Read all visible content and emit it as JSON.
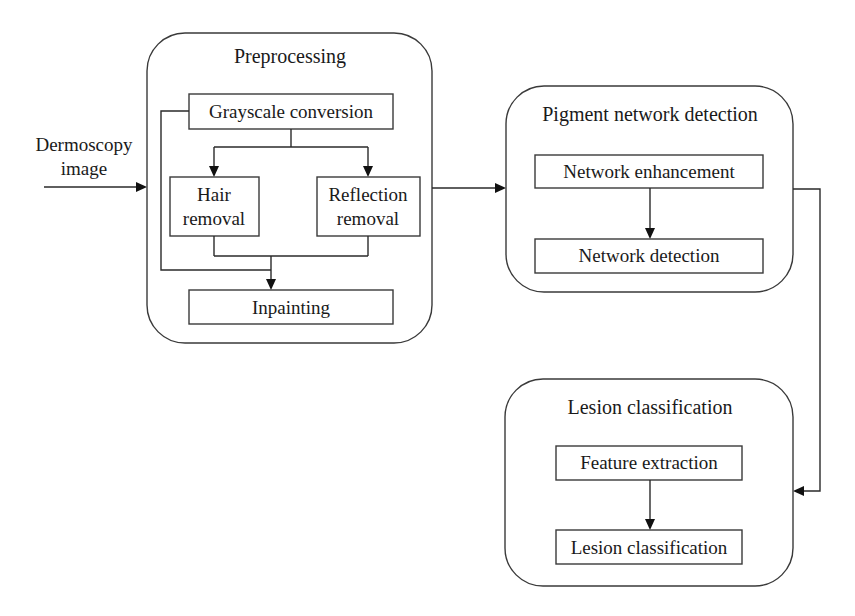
{
  "diagram": {
    "input_label": [
      "Dermoscopy",
      "image"
    ],
    "groups": {
      "preprocessing": {
        "title": "Preprocessing",
        "nodes": {
          "grayscale": "Grayscale conversion",
          "hair": [
            "Hair",
            "removal"
          ],
          "reflection": [
            "Reflection",
            "removal"
          ],
          "inpainting": "Inpainting"
        }
      },
      "pigment": {
        "title": "Pigment network detection",
        "nodes": {
          "enhancement": "Network enhancement",
          "detection": "Network detection"
        }
      },
      "lesion": {
        "title": "Lesion classification",
        "nodes": {
          "feature": "Feature extraction",
          "classification": "Lesion classification"
        }
      }
    },
    "edges": [
      {
        "from": "Dermoscopy image",
        "to": "Preprocessing"
      },
      {
        "from": "Grayscale conversion",
        "to": "Hair removal"
      },
      {
        "from": "Grayscale conversion",
        "to": "Reflection removal"
      },
      {
        "from": "Hair removal",
        "to": "Inpainting"
      },
      {
        "from": "Reflection removal",
        "to": "Inpainting"
      },
      {
        "from": "Grayscale conversion",
        "to": "Inpainting"
      },
      {
        "from": "Preprocessing",
        "to": "Pigment network detection"
      },
      {
        "from": "Network enhancement",
        "to": "Network detection"
      },
      {
        "from": "Pigment network detection",
        "to": "Lesion classification"
      },
      {
        "from": "Feature extraction",
        "to": "Lesion classification"
      }
    ]
  }
}
